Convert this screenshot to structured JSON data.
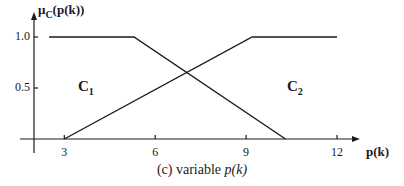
{
  "chart_data": {
    "type": "line",
    "title": "",
    "caption": "(c) variable p(k)",
    "caption_prefix": "(c) variable ",
    "caption_var": "p(k)",
    "xlabel": "p(k)",
    "ylabel": "μC(p(k))",
    "ylabel_mu": "μ",
    "ylabel_sub": "C",
    "ylabel_rest": "(p(k))",
    "xlim": [
      0.5,
      14
    ],
    "ylim": [
      0,
      1.0
    ],
    "x_ticks": [
      3,
      6,
      9,
      12
    ],
    "x_tick_labels": [
      "3",
      "6",
      "9",
      "12"
    ],
    "y_ticks": [
      0.5,
      1.0
    ],
    "y_tick_labels": [
      "0.5",
      "1.0"
    ],
    "grid": false,
    "legend": "none",
    "series": [
      {
        "name": "C1",
        "label_main": "C",
        "label_sub": "1",
        "x": [
          2.5,
          5.3,
          10.3
        ],
        "y": [
          1.0,
          1.0,
          0.0
        ]
      },
      {
        "name": "C2",
        "label_main": "C",
        "label_sub": "2",
        "x": [
          3.0,
          9.2,
          12.0
        ],
        "y": [
          0.0,
          1.0,
          1.0
        ]
      }
    ],
    "line_color": "#1a1a1a"
  },
  "layout": {
    "origin_px": [
      34,
      139
    ],
    "x0_value": 2.0,
    "x_px_per_unit": 30.3,
    "y_px_per_unit": 102,
    "x_axis_end_px": 360,
    "y_axis_top_px": 12
  }
}
